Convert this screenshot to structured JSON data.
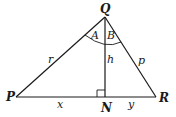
{
  "diagram": {
    "type": "right-triangle-altitude",
    "vertices": {
      "Q": "Q",
      "P": "P",
      "R": "R",
      "N": "N"
    },
    "sides": {
      "QP": "r",
      "QR": "p",
      "QN": "h",
      "PN": "x",
      "NR": "y"
    },
    "angles": {
      "left": "A",
      "right": "B"
    },
    "colors": {
      "stroke": "#1a1a1a",
      "background": "#ffffff"
    }
  }
}
